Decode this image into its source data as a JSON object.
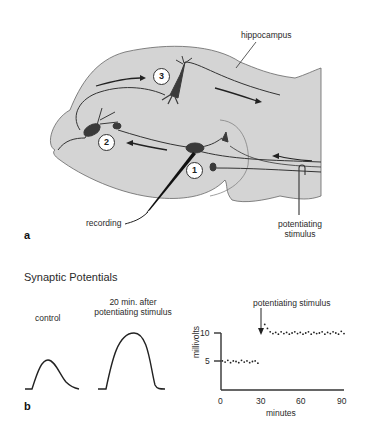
{
  "panel_a": {
    "label": "a",
    "structure_label": "hippocampus",
    "neurons": [
      {
        "id": "1",
        "label": "1"
      },
      {
        "id": "2",
        "label": "2"
      },
      {
        "id": "3",
        "label": "3"
      }
    ],
    "recording_label": "recording",
    "stimulus_label_line1": "potentiating",
    "stimulus_label_line2": "stimulus",
    "colors": {
      "tissue": "#d4d4d4",
      "outline": "#555555",
      "neuron": "#3a3a3a"
    }
  },
  "panel_b": {
    "label": "b",
    "title": "Synaptic Potentials",
    "control_label": "control",
    "after_label_line1": "20 min. after",
    "after_label_line2": "potentiating stimulus",
    "chart_annotation": "potentiating stimulus",
    "y_axis_label": "millivolts",
    "x_axis_label": "minutes",
    "y_ticks": [
      "5",
      "10"
    ],
    "x_ticks": [
      "0",
      "30",
      "60",
      "90"
    ]
  },
  "chart_data": {
    "type": "scatter",
    "title": "",
    "xlabel": "minutes",
    "ylabel": "millivolts",
    "xlim": [
      0,
      90
    ],
    "ylim": [
      0,
      12
    ],
    "x_ticks": [
      0,
      30,
      60,
      90
    ],
    "y_ticks": [
      5,
      10
    ],
    "annotations": [
      {
        "text": "potentiating stimulus",
        "x": 30,
        "arrow_to_y": 10
      }
    ],
    "series": [
      {
        "name": "before stimulus",
        "x": [
          1,
          3,
          5,
          7,
          9,
          11,
          13,
          15,
          17,
          19,
          21,
          23,
          25,
          27
        ],
        "values": [
          5.1,
          4.9,
          5.2,
          4.8,
          5.1,
          5.0,
          4.8,
          5.2,
          4.9,
          5.1,
          4.8,
          5.0,
          5.1,
          4.7
        ]
      },
      {
        "name": "after stimulus",
        "x": [
          32,
          34,
          36,
          38,
          40,
          42,
          44,
          46,
          48,
          50,
          52,
          54,
          56,
          58,
          60,
          62,
          64,
          66,
          68,
          70,
          72,
          74,
          76,
          78,
          80,
          82,
          84,
          86,
          88,
          90
        ],
        "values": [
          11.5,
          10.8,
          10.2,
          9.9,
          10.1,
          9.8,
          10.2,
          9.9,
          10.1,
          9.8,
          10.0,
          10.2,
          9.9,
          10.1,
          9.8,
          10.0,
          10.2,
          9.8,
          10.1,
          9.9,
          10.0,
          10.2,
          9.8,
          10.1,
          9.9,
          10.2,
          10.0,
          9.8,
          10.3,
          9.9
        ]
      }
    ]
  }
}
